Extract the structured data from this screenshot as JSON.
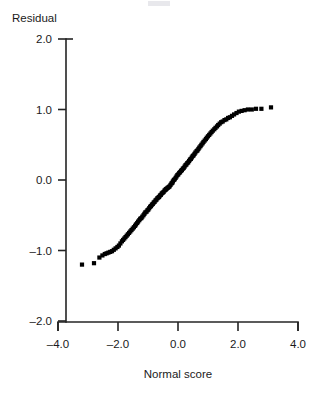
{
  "chart": {
    "type": "scatter",
    "y_axis_title": "Residual",
    "x_axis_title": "Normal score"
  },
  "chart_data": {
    "type": "scatter",
    "title": "",
    "subtitle": "",
    "xlabel": "Normal score",
    "ylabel": "Residual",
    "xlim": [
      -4.0,
      4.0
    ],
    "ylim": [
      -2.0,
      2.0
    ],
    "grid": false,
    "legend": null,
    "xticks": [
      "-4.0",
      "-2.0",
      "0.0",
      "2.0",
      "4.0"
    ],
    "xtick_values": [
      -4.0,
      -2.0,
      0.0,
      2.0,
      4.0
    ],
    "yticks": [
      "2.0",
      "1.0",
      "0.0",
      "-1.0",
      "-2.0"
    ],
    "ytick_values": [
      2.0,
      1.0,
      0.0,
      -1.0,
      -2.0
    ],
    "marker": "filled-square",
    "marker_color": "#000000",
    "series": [
      {
        "name": "Normal probability plot of residuals",
        "x": [
          -3.2,
          -2.8,
          -2.62,
          -2.52,
          -2.44,
          -2.38,
          -2.32,
          -2.26,
          -2.2,
          -2.14,
          -2.08,
          -2.02,
          -1.97,
          -1.92,
          -1.87,
          -1.83,
          -1.79,
          -1.75,
          -1.71,
          -1.67,
          -1.63,
          -1.59,
          -1.55,
          -1.51,
          -1.47,
          -1.43,
          -1.4,
          -1.36,
          -1.33,
          -1.29,
          -1.26,
          -1.22,
          -1.19,
          -1.15,
          -1.12,
          -1.09,
          -1.05,
          -1.02,
          -0.99,
          -0.96,
          -0.93,
          -0.9,
          -0.87,
          -0.84,
          -0.81,
          -0.78,
          -0.75,
          -0.72,
          -0.69,
          -0.66,
          -0.63,
          -0.6,
          -0.57,
          -0.54,
          -0.51,
          -0.48,
          -0.45,
          -0.42,
          -0.4,
          -0.37,
          -0.34,
          -0.31,
          -0.28,
          -0.25,
          -0.22,
          -0.19,
          -0.17,
          -0.14,
          -0.11,
          -0.08,
          -0.05,
          -0.02,
          0.01,
          0.04,
          0.07,
          0.1,
          0.13,
          0.16,
          0.19,
          0.22,
          0.25,
          0.28,
          0.31,
          0.34,
          0.37,
          0.4,
          0.43,
          0.46,
          0.49,
          0.52,
          0.55,
          0.58,
          0.62,
          0.65,
          0.68,
          0.71,
          0.75,
          0.78,
          0.82,
          0.85,
          0.89,
          0.93,
          0.96,
          1.0,
          1.04,
          1.08,
          1.12,
          1.16,
          1.21,
          1.25,
          1.3,
          1.34,
          1.39,
          1.44,
          1.49,
          1.55,
          1.61,
          1.67,
          1.73,
          1.8,
          1.87,
          1.95,
          2.03,
          2.12,
          2.22,
          2.33,
          2.46,
          2.6,
          2.78,
          3.1
        ],
        "y": [
          -1.2,
          -1.18,
          -1.1,
          -1.07,
          -1.05,
          -1.04,
          -1.03,
          -1.02,
          -1.01,
          -0.99,
          -0.97,
          -0.95,
          -0.93,
          -0.9,
          -0.87,
          -0.85,
          -0.83,
          -0.81,
          -0.79,
          -0.77,
          -0.75,
          -0.73,
          -0.71,
          -0.69,
          -0.67,
          -0.65,
          -0.63,
          -0.61,
          -0.59,
          -0.57,
          -0.55,
          -0.54,
          -0.52,
          -0.5,
          -0.48,
          -0.46,
          -0.45,
          -0.43,
          -0.42,
          -0.4,
          -0.38,
          -0.37,
          -0.35,
          -0.34,
          -0.32,
          -0.31,
          -0.29,
          -0.28,
          -0.26,
          -0.25,
          -0.24,
          -0.22,
          -0.21,
          -0.19,
          -0.18,
          -0.17,
          -0.15,
          -0.14,
          -0.13,
          -0.12,
          -0.11,
          -0.1,
          -0.09,
          -0.07,
          -0.05,
          -0.04,
          -0.02,
          0.0,
          0.01,
          0.03,
          0.05,
          0.07,
          0.08,
          0.1,
          0.11,
          0.13,
          0.14,
          0.16,
          0.17,
          0.19,
          0.21,
          0.22,
          0.24,
          0.25,
          0.27,
          0.29,
          0.3,
          0.32,
          0.34,
          0.35,
          0.37,
          0.39,
          0.41,
          0.42,
          0.44,
          0.46,
          0.48,
          0.5,
          0.52,
          0.54,
          0.56,
          0.58,
          0.6,
          0.62,
          0.64,
          0.66,
          0.68,
          0.7,
          0.72,
          0.74,
          0.76,
          0.78,
          0.8,
          0.82,
          0.83,
          0.85,
          0.86,
          0.88,
          0.89,
          0.91,
          0.93,
          0.95,
          0.97,
          0.98,
          0.99,
          1.0,
          1.0,
          1.01,
          1.01,
          1.03
        ]
      }
    ]
  }
}
